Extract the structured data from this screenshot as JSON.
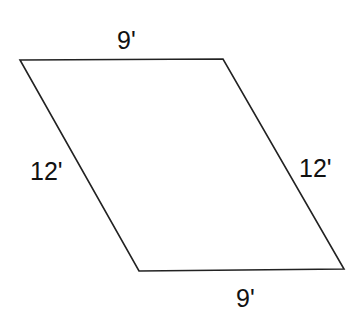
{
  "figure": {
    "shape": "parallelogram",
    "stroke_color": "#222222",
    "background": "#ffffff",
    "vertices": {
      "top_left": [
        20,
        60
      ],
      "top_right": [
        223,
        59
      ],
      "bottom_right": [
        344,
        269
      ],
      "bottom_left": [
        139,
        271
      ]
    },
    "labels": {
      "top": "9'",
      "bottom": "9'",
      "left": "12'",
      "right": "12'"
    }
  }
}
